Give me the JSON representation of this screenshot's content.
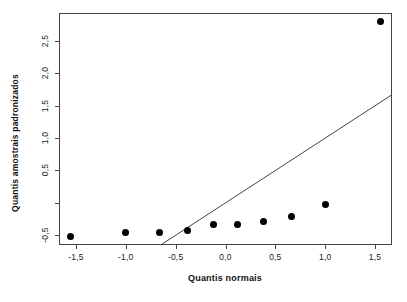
{
  "figure": {
    "background": "#ffffff",
    "box_color": "#444444",
    "tick_color": "#444444",
    "text_color": "#222222"
  },
  "chart_data": {
    "type": "scatter",
    "title": "",
    "xlabel": "Quantis normais",
    "ylabel": "Quantis amostrais padronizados",
    "xlim": [
      -1.67,
      1.67
    ],
    "ylim": [
      -0.65,
      2.93
    ],
    "grid": false,
    "legend": null,
    "points": {
      "marker": "filled-circle",
      "color": "#000000",
      "x": [
        -1.55,
        -1.0,
        -0.66,
        -0.38,
        -0.12,
        0.12,
        0.38,
        0.66,
        1.0,
        1.55
      ],
      "y": [
        -0.52,
        -0.46,
        -0.45,
        -0.42,
        -0.34,
        -0.33,
        -0.28,
        -0.21,
        -0.02,
        2.8
      ]
    },
    "reference_line": {
      "description": "identity line y = x, clipped by plot box",
      "slope": 1,
      "intercept": 0,
      "color": "#444444"
    },
    "x_ticks": {
      "values": [
        -1.5,
        -1.0,
        -0.5,
        0.0,
        0.5,
        1.0,
        1.5
      ],
      "labels": [
        "-1,5",
        "-1,0",
        "-0,5",
        "0,0",
        "0,5",
        "1,0",
        "1,5"
      ]
    },
    "y_ticks": {
      "values": [
        -0.5,
        0.0,
        0.5,
        1.0,
        1.5,
        2.0,
        2.5
      ],
      "labels": [
        "-0,5",
        "",
        "0,5",
        "1,0",
        "1,5",
        "2,0",
        "2,5"
      ]
    }
  }
}
